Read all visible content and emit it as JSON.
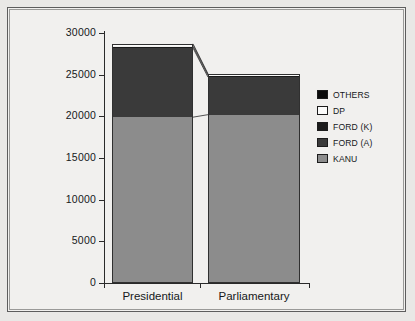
{
  "chart_data": {
    "type": "bar",
    "title": "",
    "subtitle": "",
    "xlabel": "",
    "ylabel": "",
    "categories": [
      "Presidential",
      "Parliamentary"
    ],
    "ylim": [
      0,
      30000
    ],
    "yticks": [
      0,
      5000,
      10000,
      15000,
      20000,
      25000,
      30000
    ],
    "ytick_labels": [
      "0",
      "5000",
      "10000",
      "15000",
      "20000",
      "25000",
      "30000"
    ],
    "grid": false,
    "stacked": true,
    "legend_position": "right",
    "series": [
      {
        "name": "KANU",
        "color": "#8c8c8c",
        "values": [
          19900,
          20200
        ]
      },
      {
        "name": "FORD (A)",
        "color": "#3a3a3a",
        "values": [
          8300,
          4500
        ]
      },
      {
        "name": "FORD (K)",
        "color": "#1b1b1b",
        "values": [
          180,
          180
        ]
      },
      {
        "name": "DP",
        "color": "#fbfbfa",
        "values": [
          200,
          140
        ]
      },
      {
        "name": "OTHERS",
        "color": "#0b0b0b",
        "values": [
          120,
          80
        ]
      }
    ],
    "totals": [
      28700,
      25100
    ],
    "legend_order": [
      "OTHERS",
      "DP",
      "FORD (K)",
      "FORD (A)",
      "KANU"
    ]
  },
  "legend": {
    "items": [
      {
        "label": "OTHERS",
        "color": "#0b0b0b"
      },
      {
        "label": "DP",
        "color": "#fbfbfa"
      },
      {
        "label": "FORD (K)",
        "color": "#1b1b1b"
      },
      {
        "label": "FORD (A)",
        "color": "#3a3a3a"
      },
      {
        "label": "KANU",
        "color": "#8c8c8c"
      }
    ]
  },
  "axis": {
    "y_labels": [
      "30000",
      "25000",
      "20000",
      "15000",
      "10000",
      "5000",
      "0"
    ],
    "x_labels": [
      "Presidential",
      "Parliamentary"
    ]
  }
}
